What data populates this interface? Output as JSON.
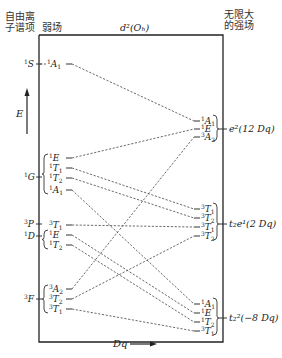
{
  "header": {
    "free_ion_label_line1": "自由离",
    "free_ion_label_line2": "子谱项",
    "weak_field_label": "弱场",
    "center_title": "d²(Oₕ)",
    "strong_field_label_line1": "无限大",
    "strong_field_label_line2": "的强场"
  },
  "axes": {
    "energy_label": "E",
    "x_label": "Dq"
  },
  "free_ion_terms": [
    {
      "mult": "1",
      "L": "S",
      "y": 64
    },
    {
      "mult": "1",
      "L": "G",
      "y": 177
    },
    {
      "mult": "3",
      "L": "P",
      "y": 224
    },
    {
      "mult": "1",
      "L": "D",
      "y": 236
    },
    {
      "mult": "3",
      "L": "F",
      "y": 299
    }
  ],
  "weak_field_states": [
    {
      "id": "w1",
      "mult": "1",
      "sym": "A",
      "sub": "1",
      "y": 64
    },
    {
      "id": "w2",
      "mult": "1",
      "sym": "E",
      "sub": "",
      "y": 158
    },
    {
      "id": "w3",
      "mult": "1",
      "sym": "T",
      "sub": "1",
      "y": 168
    },
    {
      "id": "w4",
      "mult": "1",
      "sym": "T",
      "sub": "2",
      "y": 178
    },
    {
      "id": "w5",
      "mult": "1",
      "sym": "A",
      "sub": "1",
      "y": 190
    },
    {
      "id": "w6",
      "mult": "3",
      "sym": "T",
      "sub": "1",
      "y": 225
    },
    {
      "id": "w7",
      "mult": "1",
      "sym": "E",
      "sub": "",
      "y": 235
    },
    {
      "id": "w8",
      "mult": "1",
      "sym": "T",
      "sub": "2",
      "y": 245
    },
    {
      "id": "w9",
      "mult": "3",
      "sym": "A",
      "sub": "2",
      "y": 289
    },
    {
      "id": "w10",
      "mult": "3",
      "sym": "T",
      "sub": "2",
      "y": 299
    },
    {
      "id": "w11",
      "mult": "3",
      "sym": "T",
      "sub": "1",
      "y": 309
    }
  ],
  "strong_field_groups": [
    {
      "configuration": "e²(12 Dq)",
      "y": 129,
      "states": [
        {
          "id": "s1",
          "mult": "1",
          "sym": "A",
          "sub": "1",
          "y": 121
        },
        {
          "id": "s2",
          "mult": "1",
          "sym": "E",
          "sub": "",
          "y": 129
        },
        {
          "id": "s3",
          "mult": "3",
          "sym": "A",
          "sub": "2",
          "y": 137
        }
      ]
    },
    {
      "configuration": "t₂e¹(2 Dq)",
      "y": 224,
      "states": [
        {
          "id": "s4",
          "mult": "3",
          "sym": "T",
          "sub": "1",
          "y": 209
        },
        {
          "id": "s5",
          "mult": "3",
          "sym": "T",
          "sub": "2",
          "y": 218
        },
        {
          "id": "s6",
          "mult": "3",
          "sym": "T",
          "sub": "1",
          "y": 227
        },
        {
          "id": "s7",
          "mult": "3",
          "sym": "T",
          "sub": "2",
          "y": 236
        }
      ]
    },
    {
      "configuration": "t₂²(−8 Dq)",
      "y": 318,
      "states": [
        {
          "id": "s8",
          "mult": "1",
          "sym": "A",
          "sub": "1",
          "y": 304
        },
        {
          "id": "s9",
          "mult": "1",
          "sym": "E",
          "sub": "",
          "y": 313
        },
        {
          "id": "s10",
          "mult": "1",
          "sym": "T",
          "sub": "2",
          "y": 322
        },
        {
          "id": "s11",
          "mult": "3",
          "sym": "T",
          "sub": "1",
          "y": 331
        }
      ]
    }
  ],
  "correlations": [
    [
      "w1",
      "s1"
    ],
    [
      "w2",
      "s2"
    ],
    [
      "w3",
      "s4"
    ],
    [
      "w4",
      "s5"
    ],
    [
      "w5",
      "s8"
    ],
    [
      "w6",
      "s6"
    ],
    [
      "w7",
      "s9"
    ],
    [
      "w8",
      "s10"
    ],
    [
      "w9",
      "s3"
    ],
    [
      "w10",
      "s7"
    ],
    [
      "w11",
      "s11"
    ]
  ]
}
